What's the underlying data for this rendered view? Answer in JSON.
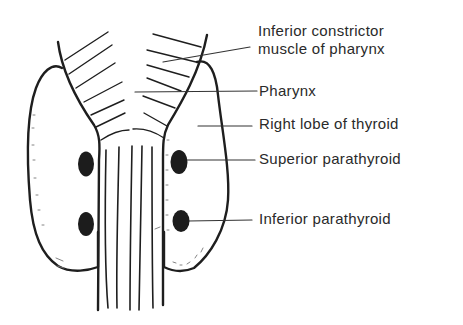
{
  "diagram": {
    "colors": {
      "ink": "#1e1e1e",
      "label": "#2a2a2a",
      "background": "#ffffff"
    },
    "labels": [
      {
        "id": "inferior-constrictor",
        "line1": "Inferior constrictor",
        "line2": "muscle of pharynx"
      },
      {
        "id": "pharynx",
        "line1": "Pharynx"
      },
      {
        "id": "right-lobe-thyroid",
        "line1": "Right lobe of thyroid"
      },
      {
        "id": "superior-parathyroid",
        "line1": "Superior parathyroid"
      },
      {
        "id": "inferior-parathyroid",
        "line1": "Inferior parathyroid"
      }
    ]
  }
}
